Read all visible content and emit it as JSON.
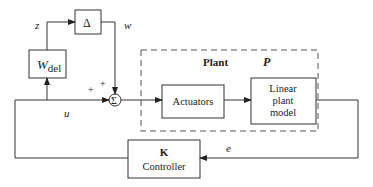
{
  "diagram": {
    "type": "block-diagram",
    "blocks": {
      "wdel": {
        "label_main": "W",
        "label_sub": "del"
      },
      "delta": {
        "label": "Δ"
      },
      "sum": {
        "label": "Σ"
      },
      "actuators": {
        "label": "Actuators"
      },
      "linear_plant": {
        "line1": "Linear",
        "line2": "plant",
        "line3": "model"
      },
      "controller": {
        "line1": "K",
        "line2": "Controller"
      }
    },
    "groups": {
      "plant": {
        "title": "Plant",
        "symbol": "P"
      }
    },
    "signals": {
      "z": "z",
      "w": "w",
      "u": "u",
      "e": "e"
    },
    "sum_signs": {
      "top": "+",
      "left": "+"
    },
    "colors": {
      "stroke": "#333333",
      "text": "#222222",
      "dash": "#555555"
    }
  }
}
